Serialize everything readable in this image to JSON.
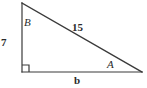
{
  "figure": {
    "type": "right-triangle-diagram",
    "background_color": "#ffffff",
    "stroke_color": "#3a3a3a",
    "text_color": "#2b2b2b",
    "stroke_width": 1.2,
    "geometry": {
      "vertices": {
        "top": {
          "x": 22,
          "y": 3
        },
        "bottom_left": {
          "x": 22,
          "y": 72
        },
        "bottom_right": {
          "x": 142,
          "y": 72
        }
      },
      "right_angle_marker": {
        "at": "bottom_left",
        "size": 7
      }
    },
    "labels": {
      "angle_top": "B",
      "leg_vertical": "7",
      "hypotenuse": "15",
      "angle_bottom_right": "A",
      "leg_horizontal": "b"
    }
  }
}
